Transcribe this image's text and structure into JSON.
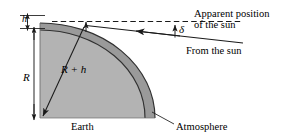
{
  "figure": {
    "colors": {
      "earth_fill": "#b3b3b3",
      "atmosphere_fill": "#9a9a9a",
      "line": "#1a1a1a",
      "background": "#ffffff"
    },
    "labels": {
      "h": "h",
      "R": "R",
      "R_plus_h": "R + h",
      "delta": "δ",
      "apparent_position_line1": "Apparent position",
      "apparent_position_line2": "of the sun",
      "from_the_sun": "From the sun",
      "earth": "Earth",
      "atmosphere": "Atmosphere"
    },
    "icons": {
      "dimension_arrow_h": "double-headed-arrow-icon",
      "dimension_arrow_R": "double-headed-arrow-icon",
      "radius_arrow": "arrow-icon",
      "sun_ray_arrow": "arrow-icon",
      "delta_angle_arrow": "arrow-icon",
      "atmosphere_leader": "leader-line-icon",
      "horizon_dashed": "dashed-line-icon"
    }
  }
}
